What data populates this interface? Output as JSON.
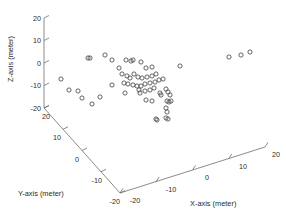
{
  "figure": {
    "caption": "",
    "background": "#ffffff",
    "marker_color": "#4a4a4a",
    "axis_color": "#6e6e6e"
  },
  "chart_data": {
    "type": "scatter",
    "projection": "3d",
    "title": "",
    "xlabel": "X-axis (meter)",
    "ylabel": "Y-axis (meter)",
    "zlabel": "Z-axis (meter)",
    "xlim": [
      -20,
      20
    ],
    "ylim": [
      -20,
      20
    ],
    "zlim": [
      -20,
      20
    ],
    "xticks": [
      -20,
      -10,
      0,
      10,
      20
    ],
    "yticks": [
      -20,
      -10,
      0,
      10,
      20
    ],
    "zticks": [
      -20,
      -10,
      0,
      10,
      20
    ],
    "xticklabels": [
      "-20",
      "-10",
      "0",
      "10",
      "20"
    ],
    "yticklabels": [
      "-20",
      "-10",
      "0",
      "10",
      "20"
    ],
    "zticklabels": [
      "-20",
      "-10",
      "0",
      "10",
      "20"
    ],
    "grid": false,
    "legend": null,
    "marker": "o",
    "marker_filled": false,
    "n_points": 62,
    "points_px": [
      [
        88,
        58
      ],
      [
        90,
        58
      ],
      [
        105,
        55
      ],
      [
        112,
        60
      ],
      [
        126,
        60
      ],
      [
        131,
        61
      ],
      [
        133,
        60
      ],
      [
        141,
        62
      ],
      [
        146,
        68
      ],
      [
        152,
        67
      ],
      [
        119,
        68
      ],
      [
        122,
        74
      ],
      [
        127,
        76
      ],
      [
        130,
        78
      ],
      [
        134,
        74
      ],
      [
        138,
        77
      ],
      [
        142,
        78
      ],
      [
        147,
        77
      ],
      [
        152,
        76
      ],
      [
        156,
        74
      ],
      [
        124,
        83
      ],
      [
        128,
        84
      ],
      [
        133,
        85
      ],
      [
        137,
        86
      ],
      [
        141,
        86
      ],
      [
        145,
        84
      ],
      [
        150,
        83
      ],
      [
        155,
        82
      ],
      [
        159,
        80
      ],
      [
        163,
        79
      ],
      [
        139,
        90
      ],
      [
        140,
        93
      ],
      [
        145,
        91
      ],
      [
        150,
        90
      ],
      [
        154,
        88
      ],
      [
        160,
        93
      ],
      [
        161,
        95
      ],
      [
        166,
        89
      ],
      [
        168,
        92
      ],
      [
        170,
        95
      ],
      [
        146,
        100
      ],
      [
        152,
        101
      ],
      [
        167,
        101
      ],
      [
        169,
        102
      ],
      [
        171,
        101
      ],
      [
        166,
        108
      ],
      [
        167,
        112
      ],
      [
        166,
        118
      ],
      [
        168,
        119
      ],
      [
        156,
        119
      ],
      [
        157,
        120
      ],
      [
        112,
        85
      ],
      [
        125,
        93
      ],
      [
        100,
        97
      ],
      [
        61,
        79
      ],
      [
        69,
        90
      ],
      [
        78,
        91
      ],
      [
        82,
        98
      ],
      [
        92,
        104
      ],
      [
        180,
        66
      ],
      [
        229,
        57
      ],
      [
        241,
        55
      ],
      [
        250,
        52
      ]
    ],
    "points_world_approx": [
      {
        "x": -6.0,
        "y": 7.5,
        "z": 0.2
      },
      {
        "x": -5.8,
        "y": 7.4,
        "z": 0.2
      },
      {
        "x": -3.4,
        "y": 6.0,
        "z": 1.0
      },
      {
        "x": -2.5,
        "y": 5.2,
        "z": 0.1
      },
      {
        "x": -0.2,
        "y": 3.4,
        "z": 0.2
      },
      {
        "x": 0.4,
        "y": 3.2,
        "z": -0.1
      },
      {
        "x": 0.7,
        "y": 3.3,
        "z": 0.1
      },
      {
        "x": 1.9,
        "y": 2.6,
        "z": -0.3
      },
      {
        "x": 2.6,
        "y": 1.6,
        "z": -1.4
      },
      {
        "x": 3.5,
        "y": 1.4,
        "z": -1.2
      },
      {
        "x": -1.2,
        "y": 4.4,
        "z": -1.5
      },
      {
        "x": -0.8,
        "y": 3.6,
        "z": -2.6
      },
      {
        "x": -0.1,
        "y": 3.2,
        "z": -3.0
      },
      {
        "x": 0.3,
        "y": 2.9,
        "z": -3.4
      },
      {
        "x": 0.9,
        "y": 3.4,
        "z": -2.5
      },
      {
        "x": 1.5,
        "y": 2.9,
        "z": -3.1
      },
      {
        "x": 2.1,
        "y": 2.7,
        "z": -3.3
      },
      {
        "x": 2.9,
        "y": 2.8,
        "z": -3.1
      },
      {
        "x": 3.6,
        "y": 3.0,
        "z": -2.9
      },
      {
        "x": 4.2,
        "y": 3.3,
        "z": -2.5
      },
      {
        "x": -0.4,
        "y": 2.2,
        "z": -4.6
      },
      {
        "x": 0.2,
        "y": 2.0,
        "z": -4.8
      },
      {
        "x": 0.9,
        "y": 1.8,
        "z": -5.0
      },
      {
        "x": 1.5,
        "y": 1.7,
        "z": -5.2
      },
      {
        "x": 2.1,
        "y": 1.7,
        "z": -5.2
      },
      {
        "x": 2.8,
        "y": 2.0,
        "z": -4.8
      },
      {
        "x": 3.6,
        "y": 2.2,
        "z": -4.6
      },
      {
        "x": 4.3,
        "y": 2.4,
        "z": -4.4
      },
      {
        "x": 4.9,
        "y": 2.7,
        "z": -4.1
      },
      {
        "x": 5.6,
        "y": 2.9,
        "z": -3.9
      },
      {
        "x": 1.8,
        "y": 1.0,
        "z": -6.4
      },
      {
        "x": 1.9,
        "y": 0.7,
        "z": -7.0
      },
      {
        "x": 2.6,
        "y": 0.9,
        "z": -6.6
      },
      {
        "x": 3.4,
        "y": 1.1,
        "z": -6.4
      },
      {
        "x": 4.0,
        "y": 1.3,
        "z": -6.0
      },
      {
        "x": 4.9,
        "y": 0.7,
        "z": -7.0
      },
      {
        "x": 5.0,
        "y": 0.5,
        "z": -7.4
      },
      {
        "x": 5.8,
        "y": 1.2,
        "z": -6.2
      },
      {
        "x": 6.1,
        "y": 0.9,
        "z": -6.8
      },
      {
        "x": 6.4,
        "y": 0.6,
        "z": -7.4
      },
      {
        "x": 2.6,
        "y": -0.5,
        "z": -8.6
      },
      {
        "x": 3.5,
        "y": -0.6,
        "z": -8.8
      },
      {
        "x": 5.9,
        "y": -0.5,
        "z": -8.8
      },
      {
        "x": 6.1,
        "y": -0.6,
        "z": -9.0
      },
      {
        "x": 6.4,
        "y": -0.4,
        "z": -8.8
      },
      {
        "x": 5.7,
        "y": -1.6,
        "z": -10.4
      },
      {
        "x": 5.8,
        "y": -2.2,
        "z": -11.2
      },
      {
        "x": 5.7,
        "y": -3.1,
        "z": -12.4
      },
      {
        "x": 6.0,
        "y": -3.2,
        "z": -12.6
      },
      {
        "x": 4.1,
        "y": -3.2,
        "z": -12.6
      },
      {
        "x": 4.2,
        "y": -3.4,
        "z": -12.8
      },
      {
        "x": -2.3,
        "y": 1.9,
        "z": -5.0
      },
      {
        "x": -0.6,
        "y": 0.7,
        "z": -7.0
      },
      {
        "x": -4.5,
        "y": 0.3,
        "z": -7.6
      },
      {
        "x": -10.9,
        "y": 3.0,
        "z": -3.1
      },
      {
        "x": -9.4,
        "y": 1.2,
        "z": -6.4
      },
      {
        "x": -7.9,
        "y": 1.1,
        "z": -6.6
      },
      {
        "x": -7.2,
        "y": 0.0,
        "z": -8.2
      },
      {
        "x": -5.5,
        "y": -1.0,
        "z": -9.6
      },
      {
        "x": 8.9,
        "y": 1.9,
        "z": -1.4
      },
      {
        "x": 16.6,
        "y": 6.4,
        "z": 0.6
      },
      {
        "x": 18.3,
        "y": 7.0,
        "z": 1.2
      },
      {
        "x": 19.6,
        "y": 7.6,
        "z": 1.8
      }
    ]
  }
}
